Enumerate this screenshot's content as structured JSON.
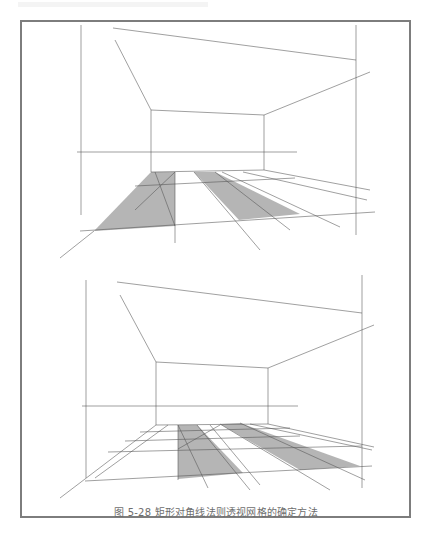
{
  "figure": {
    "caption": "图 5-28 矩形对角线法则透视网格的确定方法",
    "frame_color": "#7d7d7d",
    "line_color": "#555555",
    "shade_color": "#a8a8a8"
  },
  "drawings": [
    {
      "name": "step-1",
      "guide_lines": [
        [
          81,
          25,
          81,
          215
        ],
        [
          356,
          25,
          356,
          235
        ],
        [
          115,
          40,
          151,
          110
        ],
        [
          113,
          28,
          356,
          60
        ],
        [
          151,
          110,
          264,
          115
        ],
        [
          264,
          115,
          370,
          72
        ],
        [
          151,
          110,
          151,
          172
        ],
        [
          264,
          115,
          264,
          170
        ],
        [
          77,
          152,
          297,
          152
        ],
        [
          151,
          172,
          264,
          170
        ],
        [
          135,
          186,
          295,
          178
        ],
        [
          80,
          231,
          375,
          212
        ],
        [
          175,
          172,
          175,
          243
        ],
        [
          94,
          231,
          60,
          258
        ],
        [
          264,
          170,
          370,
          190
        ],
        [
          243,
          172,
          367,
          200
        ],
        [
          222,
          172,
          340,
          227
        ],
        [
          194,
          172,
          260,
          250
        ],
        [
          155,
          172,
          175,
          226
        ],
        [
          175,
          172,
          135,
          210
        ],
        [
          215,
          172,
          290,
          230
        ]
      ],
      "shaded_polygons": [
        [
          [
            94,
            231
          ],
          [
            151,
            172
          ],
          [
            175,
            172
          ],
          [
            175,
            226
          ]
        ],
        [
          [
            194,
            172
          ],
          [
            215,
            172
          ],
          [
            300,
            214
          ],
          [
            239,
            220
          ]
        ]
      ]
    },
    {
      "name": "step-2",
      "guide_lines": [
        [
          86,
          280,
          86,
          478
        ],
        [
          362,
          275,
          362,
          488
        ],
        [
          120,
          295,
          156,
          362
        ],
        [
          117,
          282,
          362,
          313
        ],
        [
          156,
          362,
          268,
          368
        ],
        [
          268,
          368,
          374,
          325
        ],
        [
          156,
          362,
          156,
          425
        ],
        [
          268,
          368,
          268,
          424
        ],
        [
          82,
          406,
          298,
          406
        ],
        [
          156,
          425,
          268,
          424
        ],
        [
          140,
          432,
          290,
          428
        ],
        [
          125,
          441,
          300,
          436
        ],
        [
          108,
          452,
          362,
          446
        ],
        [
          85,
          481,
          372,
          466
        ],
        [
          178,
          425,
          178,
          480
        ],
        [
          156,
          425,
          60,
          498
        ],
        [
          168,
          425,
          95,
          478
        ],
        [
          178,
          425,
          208,
          488
        ],
        [
          197,
          425,
          250,
          490
        ],
        [
          178,
          449,
          220,
          425
        ],
        [
          220,
          424,
          330,
          490
        ],
        [
          240,
          423,
          365,
          480
        ],
        [
          210,
          425,
          260,
          485
        ],
        [
          250,
          424,
          372,
          450
        ],
        [
          268,
          424,
          374,
          447
        ]
      ],
      "shaded_polygons": [
        [
          [
            178,
            425
          ],
          [
            197,
            425
          ],
          [
            243,
            473
          ],
          [
            178,
            479
          ]
        ],
        [
          [
            220,
            424
          ],
          [
            240,
            423
          ],
          [
            360,
            466
          ],
          [
            300,
            470
          ]
        ]
      ]
    }
  ]
}
